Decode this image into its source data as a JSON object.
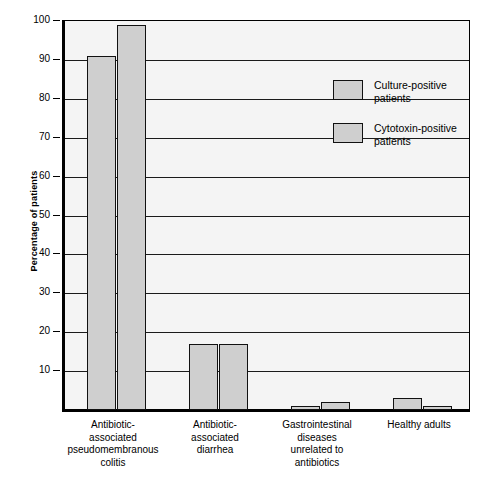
{
  "chart_data": {
    "type": "bar",
    "title": "",
    "xlabel": "",
    "ylabel": "Percentage of patients",
    "ylim": [
      0,
      100
    ],
    "grid": true,
    "legend_position": "upper-center-right",
    "categories": [
      "Antibiotic-\nassociated\npseudomembranous\ncolitis",
      "Antibiotic-\nassociated\ndiarrhea",
      "Gastrointestinal\ndiseases\nunrelated to\nantibiotics",
      "Healthy adults"
    ],
    "yticks": [
      0,
      10,
      20,
      30,
      40,
      50,
      60,
      70,
      80,
      90,
      100
    ],
    "series": [
      {
        "name": "Culture-positive patients",
        "color": "#cfcfcf",
        "values": [
          91,
          17,
          1,
          3
        ]
      },
      {
        "name": "Cytotoxin-positive patients",
        "color": "#cfcfcf",
        "values": [
          99,
          17,
          2,
          1
        ]
      }
    ]
  },
  "axis": {
    "ylabel": "Percentage of patients",
    "tick_labels": [
      "100",
      "90",
      "80",
      "70",
      "60",
      "50",
      "40",
      "30",
      "20",
      "10"
    ]
  },
  "legend": {
    "items": [
      {
        "line1": "Culture-positive",
        "line2": "patients"
      },
      {
        "line1": "Cytotoxin-positive",
        "line2": "patients"
      }
    ]
  },
  "categories": [
    {
      "lines": [
        "Antibiotic-",
        "associated",
        "pseudomembranous",
        "colitis"
      ]
    },
    {
      "lines": [
        "Antibiotic-",
        "associated",
        "diarrhea"
      ]
    },
    {
      "lines": [
        "Gastrointestinal",
        "diseases",
        "unrelated to",
        "antibiotics"
      ]
    },
    {
      "lines": [
        "Healthy adults"
      ]
    }
  ]
}
